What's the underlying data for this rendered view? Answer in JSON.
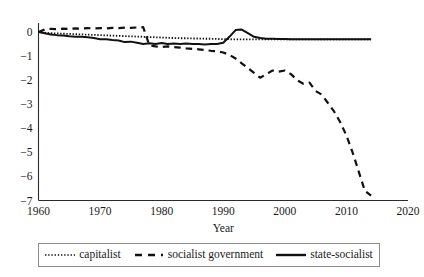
{
  "chart_data": {
    "type": "line",
    "title": "",
    "xlabel": "Year",
    "ylabel": "",
    "xlim": [
      1960,
      2020
    ],
    "ylim": [
      -7,
      0.35
    ],
    "grid": false,
    "legend_position": "bottom",
    "xticks": [
      "1960",
      "1970",
      "1980",
      "1990",
      "2000",
      "2010",
      "2020"
    ],
    "xtick_values": [
      1960,
      1970,
      1980,
      1990,
      2000,
      2010,
      2020
    ],
    "yticks": [
      "0",
      "−1",
      "−2",
      "−3",
      "−4",
      "−5",
      "−6",
      "−7"
    ],
    "ytick_values": [
      0,
      -1,
      -2,
      -3,
      -4,
      -5,
      -6,
      -7
    ],
    "series": [
      {
        "name": "capitalist",
        "style": "dotted",
        "color": "#111111",
        "x": [
          1960,
          1961,
          1962,
          1963,
          1964,
          1965,
          1966,
          1967,
          1968,
          1969,
          1970,
          1971,
          1972,
          1973,
          1974,
          1975,
          1976,
          1977,
          1978,
          1979,
          1980,
          1981,
          1982,
          1983,
          1984,
          1985,
          1986,
          1987,
          1988,
          1989,
          1990,
          1991,
          1992,
          1993,
          1994,
          1995,
          1996,
          1997,
          1998,
          1999,
          2000,
          2001,
          2002,
          2003,
          2004,
          2005,
          2006,
          2007,
          2008,
          2009,
          2010,
          2011,
          2012,
          2013,
          2014
        ],
        "values": [
          0.0,
          -0.03,
          -0.05,
          -0.06,
          -0.07,
          -0.08,
          -0.09,
          -0.1,
          -0.11,
          -0.12,
          -0.13,
          -0.14,
          -0.15,
          -0.16,
          -0.17,
          -0.18,
          -0.19,
          -0.2,
          -0.21,
          -0.22,
          -0.23,
          -0.24,
          -0.25,
          -0.26,
          -0.26,
          -0.27,
          -0.27,
          -0.28,
          -0.28,
          -0.29,
          -0.3,
          -0.3,
          -0.31,
          -0.31,
          -0.31,
          -0.31,
          -0.31,
          -0.31,
          -0.31,
          -0.31,
          -0.31,
          -0.31,
          -0.31,
          -0.31,
          -0.31,
          -0.31,
          -0.31,
          -0.31,
          -0.31,
          -0.31,
          -0.31,
          -0.31,
          -0.31,
          -0.31,
          -0.31
        ]
      },
      {
        "name": "socialist government",
        "style": "dashed",
        "color": "#111111",
        "x": [
          1960,
          1961,
          1962,
          1963,
          1964,
          1965,
          1966,
          1967,
          1968,
          1969,
          1970,
          1971,
          1972,
          1973,
          1974,
          1975,
          1976,
          1977,
          1978,
          1979,
          1980,
          1981,
          1982,
          1983,
          1984,
          1985,
          1986,
          1987,
          1988,
          1989,
          1990,
          1991,
          1992,
          1993,
          1994,
          1995,
          1996,
          1997,
          1998,
          1999,
          2000,
          2001,
          2002,
          2003,
          2004,
          2005,
          2006,
          2007,
          2008,
          2009,
          2010,
          2011,
          2012,
          2013,
          2014
        ],
        "values": [
          0.0,
          0.1,
          0.13,
          0.12,
          0.14,
          0.13,
          0.15,
          0.14,
          0.16,
          0.15,
          0.16,
          0.15,
          0.17,
          0.16,
          0.18,
          0.17,
          0.19,
          0.2,
          -0.55,
          -0.6,
          -0.62,
          -0.6,
          -0.63,
          -0.65,
          -0.68,
          -0.7,
          -0.72,
          -0.75,
          -0.78,
          -0.8,
          -0.85,
          -0.95,
          -1.1,
          -1.3,
          -1.5,
          -1.7,
          -1.9,
          -1.75,
          -1.6,
          -1.65,
          -1.6,
          -1.75,
          -2.0,
          -2.15,
          -2.1,
          -2.45,
          -2.6,
          -2.95,
          -3.3,
          -3.75,
          -4.3,
          -5.0,
          -5.8,
          -6.6,
          -6.8
        ]
      },
      {
        "name": "state-socialist",
        "style": "solid",
        "color": "#111111",
        "x": [
          1960,
          1961,
          1962,
          1963,
          1964,
          1965,
          1966,
          1967,
          1968,
          1969,
          1970,
          1971,
          1972,
          1973,
          1974,
          1975,
          1976,
          1977,
          1978,
          1979,
          1980,
          1981,
          1982,
          1983,
          1984,
          1985,
          1986,
          1987,
          1988,
          1989,
          1990,
          1991,
          1992,
          1993,
          1994,
          1995,
          1996,
          1997,
          1998,
          1999,
          2000,
          2001,
          2002,
          2003,
          2004,
          2005,
          2006,
          2007,
          2008,
          2009,
          2010,
          2011,
          2012,
          2013,
          2014
        ],
        "values": [
          0.0,
          -0.05,
          -0.1,
          -0.13,
          -0.15,
          -0.18,
          -0.2,
          -0.2,
          -0.22,
          -0.25,
          -0.3,
          -0.3,
          -0.33,
          -0.35,
          -0.42,
          -0.4,
          -0.45,
          -0.5,
          -0.47,
          -0.5,
          -0.46,
          -0.5,
          -0.48,
          -0.5,
          -0.48,
          -0.5,
          -0.5,
          -0.52,
          -0.5,
          -0.5,
          -0.45,
          -0.2,
          0.08,
          0.1,
          -0.05,
          -0.2,
          -0.25,
          -0.28,
          -0.28,
          -0.29,
          -0.29,
          -0.3,
          -0.3,
          -0.3,
          -0.3,
          -0.3,
          -0.3,
          -0.3,
          -0.3,
          -0.3,
          -0.3,
          -0.3,
          -0.3,
          -0.3,
          -0.3
        ]
      }
    ]
  },
  "legend": {
    "items": [
      {
        "label": "capitalist",
        "style": "dotted"
      },
      {
        "label": "socialist government",
        "style": "dashed"
      },
      {
        "label": "state-socialist",
        "style": "solid"
      }
    ]
  },
  "axes": {
    "x_title": "Year"
  }
}
